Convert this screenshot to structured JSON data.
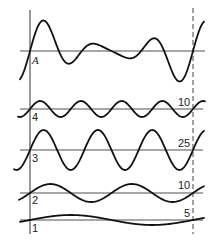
{
  "diagram": {
    "composite": {
      "label": "A",
      "axis_y": 51
    },
    "components": [
      {
        "label": "4",
        "amplitude_label": "10",
        "cycles": 4,
        "axis_y": 109,
        "amplitude_px": 8
      },
      {
        "label": "3",
        "amplitude_label": "25",
        "cycles": 3,
        "axis_y": 150,
        "amplitude_px": 20
      },
      {
        "label": "2",
        "amplitude_label": "10",
        "cycles": 2,
        "axis_y": 193,
        "amplitude_px": 9
      },
      {
        "label": "1",
        "amplitude_label": "5",
        "cycles": 1,
        "axis_y": 220,
        "amplitude_px": 5
      }
    ],
    "period_start_x": 30,
    "period_end_x": 193,
    "colors": {
      "wave": "#111111",
      "axis": "#8a8a8a",
      "background": "#ffffff"
    }
  }
}
